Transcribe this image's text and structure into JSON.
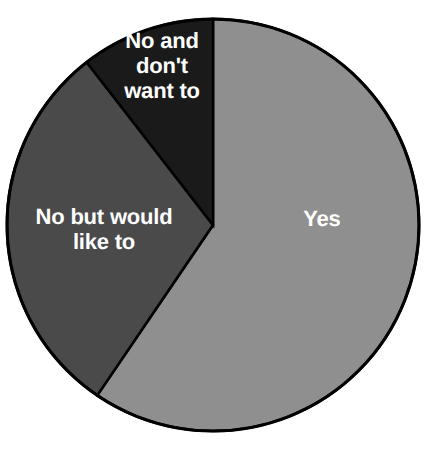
{
  "chart_data": {
    "type": "pie",
    "title": "",
    "subtitle": "",
    "xlabel": "",
    "ylabel": "",
    "legend": "none",
    "grid": false,
    "labels_position": "inside-slices",
    "start_angle_deg": 0,
    "direction": "clockwise",
    "categories": [
      "Yes",
      "No but would like to",
      "No and don't want to"
    ],
    "values": [
      59.5,
      30.0,
      10.5
    ],
    "slices": [
      {
        "label": "Yes",
        "value": 59.5,
        "color": "#8f8f8f",
        "text_color": "#ffffff",
        "start_angle_deg": 0,
        "end_angle_deg": 214.2
      },
      {
        "label": "No but would like to",
        "value": 30.0,
        "color": "#4a4a4a",
        "text_color": "#ffffff",
        "start_angle_deg": 214.2,
        "end_angle_deg": 322.2
      },
      {
        "label": "No and don't want to",
        "value": 10.5,
        "color": "#1a1a1a",
        "text_color": "#ffffff",
        "start_angle_deg": 322.2,
        "end_angle_deg": 360
      }
    ]
  },
  "figure": {
    "background": "#ffffff",
    "outline_color": "#000000",
    "center_x": 213,
    "center_y": 225,
    "radius": 206
  },
  "labels": {
    "yes": "Yes",
    "no_but_would_like_to": "No but would\nlike to",
    "no_and_dont_want_to": "No and\ndon't\nwant to"
  }
}
